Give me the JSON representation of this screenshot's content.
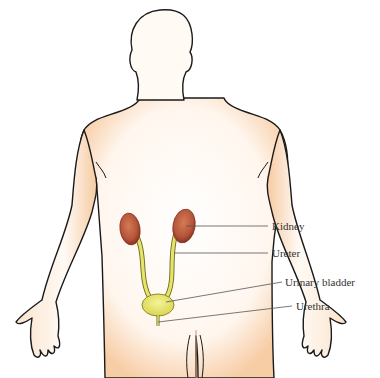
{
  "figure": {
    "labels": [
      {
        "id": "kidney",
        "text": "Kidney",
        "x": 272,
        "y": 222
      },
      {
        "id": "ureter",
        "text": "Ureter",
        "x": 272,
        "y": 250
      },
      {
        "id": "bladder",
        "text": "Urinary bladder",
        "x": 285,
        "y": 278
      },
      {
        "id": "urethra",
        "text": "Urethra",
        "x": 296,
        "y": 302
      }
    ],
    "colors": {
      "outline": "#1a1a1a",
      "skin_shade": "#f6c9a0",
      "kidney": "#b5553a",
      "kidney_dark": "#8a3424",
      "ureter": "#e6e36a",
      "bladder": "#e8e66a",
      "leader_line": "#555555"
    }
  }
}
